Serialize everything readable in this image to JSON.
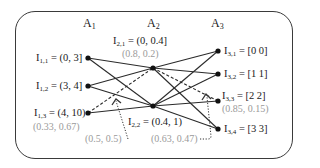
{
  "headers": [
    {
      "name": "A",
      "sub": "1"
    },
    {
      "name": "A",
      "sub": "2"
    },
    {
      "name": "A",
      "sub": "3"
    }
  ],
  "nodes": {
    "a1": [
      {
        "id": "I1,1",
        "name": "I",
        "sub": "1,1",
        "value": "= (0, 3]",
        "prob": ""
      },
      {
        "id": "I1,2",
        "name": "I",
        "sub": "1,2",
        "value": "= (3, 4]",
        "prob": ""
      },
      {
        "id": "I1,3",
        "name": "I",
        "sub": "1,3",
        "value": "= (4, 10)",
        "prob": "(0.33, 0.67)"
      }
    ],
    "a2": [
      {
        "id": "I2,1",
        "name": "I",
        "sub": "2,1",
        "value": "= (0, 0.4]",
        "prob": "(0.8, 0.2)"
      },
      {
        "id": "I2,2",
        "name": "I",
        "sub": "2,2",
        "value": "= (0.4, 1)",
        "prob": ""
      }
    ],
    "a3": [
      {
        "id": "I3,1",
        "name": "I",
        "sub": "3,1",
        "value": "= [0 0]",
        "prob": ""
      },
      {
        "id": "I3,2",
        "name": "I",
        "sub": "3,2",
        "value": "= [1 1]",
        "prob": ""
      },
      {
        "id": "I3,3",
        "name": "I",
        "sub": "3,3",
        "value": "= [2 2]",
        "prob": "(0.85, 0.15)"
      },
      {
        "id": "I3,4",
        "name": "I",
        "sub": "3,4",
        "value": "= [3 3]",
        "prob": ""
      }
    ]
  },
  "edges": [
    {
      "from": "I1,1",
      "to": "I2,1",
      "style": "solid"
    },
    {
      "from": "I1,1",
      "to": "I2,2",
      "style": "solid"
    },
    {
      "from": "I1,2",
      "to": "I2,1",
      "style": "solid"
    },
    {
      "from": "I1,2",
      "to": "I2,2",
      "style": "solid"
    },
    {
      "from": "I1,3",
      "to": "I2,1",
      "style": "dashed"
    },
    {
      "from": "I1,3",
      "to": "I2,2",
      "style": "solid"
    },
    {
      "from": "I2,1",
      "to": "I3,1",
      "style": "solid"
    },
    {
      "from": "I2,1",
      "to": "I3,2",
      "style": "solid"
    },
    {
      "from": "I2,1",
      "to": "I3,3",
      "style": "dashed"
    },
    {
      "from": "I2,1",
      "to": "I3,4",
      "style": "solid"
    },
    {
      "from": "I2,2",
      "to": "I3,1",
      "style": "solid"
    },
    {
      "from": "I2,2",
      "to": "I3,2",
      "style": "solid"
    },
    {
      "from": "I2,2",
      "to": "I3,3",
      "style": "solid"
    },
    {
      "from": "I2,2",
      "to": "I3,4",
      "style": "solid"
    }
  ],
  "annotations": [
    {
      "text": "(0.5, 0.5)",
      "points_to": "edge I1,3 - I2,1"
    },
    {
      "text": "(0.63, 0.47)",
      "points_to": "edge I2,1 - I3,3"
    }
  ],
  "colors": {
    "line": "#2a2a2a",
    "prob_text": "#9a9a9a",
    "frame": "#3a3a3a"
  }
}
